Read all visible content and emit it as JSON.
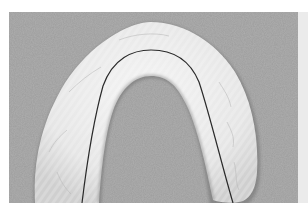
{
  "image": {
    "subject": "Dental arch impression (U-shaped cast) with dark center line on gray textured background",
    "alt": "U-shaped white dental impression with a thin dark line tracing the arch",
    "colors": {
      "background": "#9a9a9a",
      "cast": "#ececec",
      "cast_shadow": "#c4c4c4",
      "line": "#2a2a2a",
      "side_strip": "#ebebeb"
    }
  }
}
